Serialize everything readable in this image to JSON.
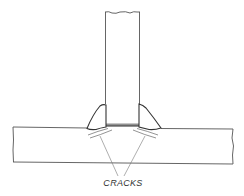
{
  "diagram": {
    "labels": {
      "cracks": "CRACKS"
    },
    "colors": {
      "line": "#444444",
      "weld_fill": "#ffffff",
      "background": "#ffffff"
    }
  }
}
